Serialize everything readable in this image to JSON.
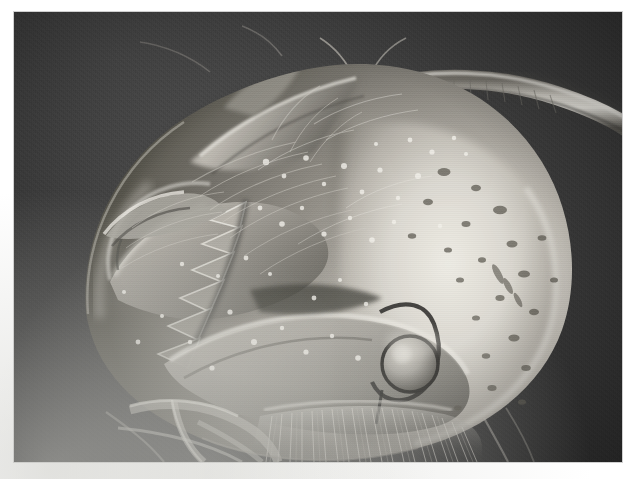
{
  "figure": {
    "kind": "scanning-electron-micrograph",
    "background_color": "#3a3a3a",
    "plate": {
      "x": 14,
      "y": 12,
      "width": 608,
      "height": 450
    },
    "page_color": "#ffffff",
    "caption_text": ""
  },
  "specimen": {
    "name": "head capsule",
    "description": "rounded sclerotised head with toothed mandible, antenna and dense setae",
    "highlight_color": "#e8e6e0",
    "midtone_color": "#9a9892",
    "shadow_color": "#2e2e2e",
    "parts": [
      {
        "id": "cranium",
        "label": "cranium / head capsule"
      },
      {
        "id": "mandible",
        "label": "toothed mandible"
      },
      {
        "id": "mandible-teeth",
        "label": "mandibular teeth (serrations)"
      },
      {
        "id": "antenna",
        "label": "antenna"
      },
      {
        "id": "antennal-socket",
        "label": "antennal socket"
      },
      {
        "id": "labrum",
        "label": "labrum / clypeal plate"
      },
      {
        "id": "palp",
        "label": "maxillary palp"
      },
      {
        "id": "eye-spot",
        "label": "ocular lens / stemma"
      },
      {
        "id": "setae",
        "label": "setae (fine hairs)"
      },
      {
        "id": "cuticle-pits",
        "label": "cuticular pits and pores"
      }
    ],
    "tooth_count": 6
  }
}
